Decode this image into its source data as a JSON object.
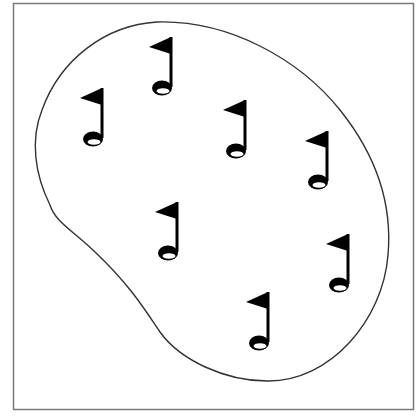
{
  "figure": {
    "colors": {
      "background": "#ffffff",
      "frame": "#7a7a7a",
      "outline": "#333333",
      "flag": "#000000",
      "hole_inner": "#ffffff"
    },
    "flag_count": 7,
    "flags": [
      {
        "id": 1,
        "icon": "golf-flag-icon"
      },
      {
        "id": 2,
        "icon": "golf-flag-icon"
      },
      {
        "id": 3,
        "icon": "golf-flag-icon"
      },
      {
        "id": 4,
        "icon": "golf-flag-icon"
      },
      {
        "id": 5,
        "icon": "golf-flag-icon"
      },
      {
        "id": 6,
        "icon": "golf-flag-icon"
      },
      {
        "id": 7,
        "icon": "golf-flag-icon"
      }
    ]
  }
}
